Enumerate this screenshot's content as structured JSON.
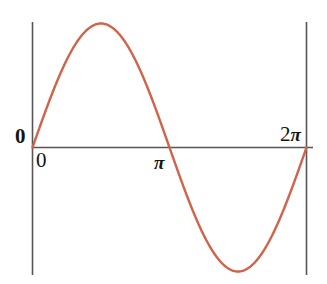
{
  "figure": {
    "background_color": "#ffffff",
    "width": 327,
    "height": 284
  },
  "labels": {
    "zero_y": "0",
    "zero_x": "0",
    "pi": "π",
    "two_pi_number": "2",
    "two_pi_symbol": "π"
  },
  "chart_data": {
    "type": "line",
    "title": "",
    "subtitle": "",
    "xlabel": "",
    "ylabel": "",
    "function": "sin(x)",
    "curve_color": "#d0634a",
    "axis_color": "#555555",
    "curve_width": 2.4,
    "axis_width": 1.6,
    "grid": false,
    "legend": null,
    "xlim": [
      0,
      6.283185307179586
    ],
    "ylim": [
      -1.12,
      1.12
    ],
    "xticks": [
      0,
      3.141592653589793,
      6.283185307179586
    ],
    "xticklabels": [
      "0",
      "π",
      "2π"
    ],
    "yticks": [
      0
    ],
    "yticklabels": [
      "0"
    ],
    "x": [
      0,
      0.2094,
      0.4189,
      0.6283,
      0.8378,
      1.0472,
      1.2566,
      1.4661,
      1.6755,
      1.885,
      2.0944,
      2.3038,
      2.5133,
      2.7227,
      2.9322,
      3.1416,
      3.351,
      3.5605,
      3.7699,
      3.9794,
      4.1888,
      4.3982,
      4.6077,
      4.8171,
      5.0265,
      5.236,
      5.4454,
      5.6549,
      5.8643,
      6.0737,
      6.2832
    ],
    "y": [
      0,
      0.2079,
      0.4067,
      0.5878,
      0.7431,
      0.866,
      0.9511,
      0.9945,
      0.9945,
      0.9511,
      0.866,
      0.7431,
      0.5878,
      0.4067,
      0.2079,
      0,
      -0.2079,
      -0.4067,
      -0.5878,
      -0.7431,
      -0.866,
      -0.9511,
      -0.9945,
      -0.9945,
      -0.9511,
      -0.866,
      -0.7431,
      -0.5878,
      -0.4067,
      -0.2079,
      0
    ],
    "annotations": [
      {
        "name": "origin",
        "x": 0,
        "y": 0
      },
      {
        "name": "maximum",
        "x": 1.5708,
        "y": 1
      },
      {
        "name": "zero-crossing",
        "x": 3.141592653589793,
        "y": 0
      },
      {
        "name": "minimum",
        "x": 4.7124,
        "y": -1
      },
      {
        "name": "end",
        "x": 6.283185307179586,
        "y": 0
      }
    ],
    "axes_geometry": {
      "left_axis_x": 32.5,
      "right_axis_x": 306.5,
      "axis_top_y": 22,
      "axis_bottom_y": 275,
      "x_axis_y": 147.5,
      "x_axis_left": 32.5,
      "x_axis_right": 313,
      "amplitude_px": 124,
      "period_px": 274
    }
  }
}
